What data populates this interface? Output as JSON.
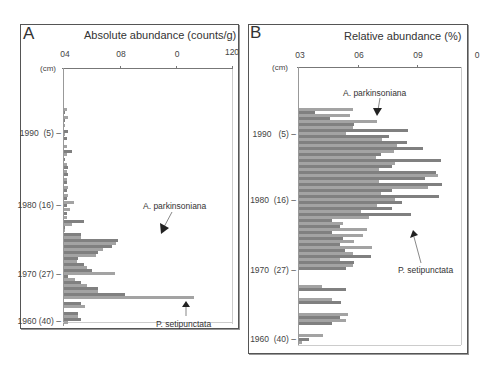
{
  "chart_data": [
    {
      "type": "bar",
      "orientation": "horizontal",
      "panel_letter": "A",
      "title": "Absolute abundance (counts/g)",
      "x_tick_labels": [
        "04",
        "08",
        "0",
        "120"
      ],
      "xlim": [
        0,
        120
      ],
      "ylabel": "(cm)",
      "y_tick_labels": [
        "1990 (5)",
        "1980 (16)",
        "1970 (27)",
        "1960 (40)"
      ],
      "annotations": [
        "A. parkinsoniana",
        "P. setipunctata"
      ],
      "series_colors": {
        "A. parkinsoniana": "#9a9a9a",
        "P. setipunctata": "#7d7d7d"
      },
      "bars": [
        {
          "y": 108,
          "v": 2,
          "s": 0
        },
        {
          "y": 111,
          "v": 1,
          "s": 1
        },
        {
          "y": 116,
          "v": 3,
          "s": 0
        },
        {
          "y": 119,
          "v": 1,
          "s": 1
        },
        {
          "y": 124,
          "v": 1,
          "s": 0
        },
        {
          "y": 130,
          "v": 3,
          "s": 1
        },
        {
          "y": 133,
          "v": 1,
          "s": 0
        },
        {
          "y": 137,
          "v": 2,
          "s": 1
        },
        {
          "y": 145,
          "v": 2,
          "s": 0
        },
        {
          "y": 150,
          "v": 6,
          "s": 1
        },
        {
          "y": 153,
          "v": 2,
          "s": 0
        },
        {
          "y": 158,
          "v": 1,
          "s": 1
        },
        {
          "y": 163,
          "v": 2,
          "s": 0
        },
        {
          "y": 166,
          "v": 3,
          "s": 1
        },
        {
          "y": 170,
          "v": 2,
          "s": 0
        },
        {
          "y": 173,
          "v": 3,
          "s": 1
        },
        {
          "y": 178,
          "v": 2,
          "s": 0
        },
        {
          "y": 181,
          "v": 2,
          "s": 1
        },
        {
          "y": 186,
          "v": 3,
          "s": 0
        },
        {
          "y": 189,
          "v": 2,
          "s": 1
        },
        {
          "y": 194,
          "v": 3,
          "s": 0
        },
        {
          "y": 197,
          "v": 2,
          "s": 1
        },
        {
          "y": 201,
          "v": 7,
          "s": 0
        },
        {
          "y": 204,
          "v": 2,
          "s": 1
        },
        {
          "y": 208,
          "v": 4,
          "s": 0
        },
        {
          "y": 212,
          "v": 2,
          "s": 1
        },
        {
          "y": 216,
          "v": 2,
          "s": 0
        },
        {
          "y": 220,
          "v": 14,
          "s": 1
        },
        {
          "y": 223,
          "v": 6,
          "s": 0
        },
        {
          "y": 226,
          "v": 1,
          "s": 1
        },
        {
          "y": 229,
          "v": 1,
          "s": 0
        },
        {
          "y": 233,
          "v": 12,
          "s": 1
        },
        {
          "y": 236,
          "v": 12,
          "s": 0
        },
        {
          "y": 239,
          "v": 38,
          "s": 1
        },
        {
          "y": 242,
          "v": 37,
          "s": 0
        },
        {
          "y": 245,
          "v": 34,
          "s": 1
        },
        {
          "y": 248,
          "v": 28,
          "s": 0
        },
        {
          "y": 251,
          "v": 24,
          "s": 1
        },
        {
          "y": 254,
          "v": 23,
          "s": 0
        },
        {
          "y": 257,
          "v": 10,
          "s": 1
        },
        {
          "y": 260,
          "v": 9,
          "s": 0
        },
        {
          "y": 263,
          "v": 14,
          "s": 1
        },
        {
          "y": 266,
          "v": 16,
          "s": 0
        },
        {
          "y": 269,
          "v": 20,
          "s": 1
        },
        {
          "y": 272,
          "v": 36,
          "s": 0
        },
        {
          "y": 275,
          "v": 3,
          "s": 1
        },
        {
          "y": 278,
          "v": 8,
          "s": 0
        },
        {
          "y": 281,
          "v": 12,
          "s": 1
        },
        {
          "y": 284,
          "v": 16,
          "s": 0
        },
        {
          "y": 287,
          "v": 24,
          "s": 1
        },
        {
          "y": 290,
          "v": 24,
          "s": 0
        },
        {
          "y": 293,
          "v": 43,
          "s": 1
        },
        {
          "y": 296,
          "v": 92,
          "s": 0
        },
        {
          "y": 302,
          "v": 12,
          "s": 1
        },
        {
          "y": 305,
          "v": 15,
          "s": 0
        },
        {
          "y": 312,
          "v": 10,
          "s": 1
        },
        {
          "y": 315,
          "v": 10,
          "s": 0
        },
        {
          "y": 318,
          "v": 12,
          "s": 1
        },
        {
          "y": 321,
          "v": 3,
          "s": 0
        }
      ]
    },
    {
      "type": "bar",
      "orientation": "horizontal",
      "panel_letter": "B",
      "title": "Relative abundance (%)",
      "x_tick_labels": [
        "03",
        "06",
        "09",
        "0"
      ],
      "xlim": [
        0,
        100
      ],
      "ylabel": "(cm)",
      "y_tick_labels": [
        "1990 (5)",
        "1980 (16)",
        "1970 (27)",
        "1960 (40)"
      ],
      "annotations": [
        "A. parkinsoniana",
        "P. setipunctata"
      ],
      "series_colors": {
        "A. parkinsoniana": "#9a9a9a",
        "P. setipunctata": "#7d7d7d"
      },
      "bars": [
        {
          "y": 108,
          "v": 33,
          "s": 0
        },
        {
          "y": 111,
          "v": 10,
          "s": 1
        },
        {
          "y": 114,
          "v": 31,
          "s": 0
        },
        {
          "y": 117,
          "v": 19,
          "s": 1
        },
        {
          "y": 120,
          "v": 48,
          "s": 0
        },
        {
          "y": 123,
          "v": 34,
          "s": 1
        },
        {
          "y": 126,
          "v": 33,
          "s": 0
        },
        {
          "y": 129,
          "v": 67,
          "s": 1
        },
        {
          "y": 132,
          "v": 29,
          "s": 0
        },
        {
          "y": 135,
          "v": 55,
          "s": 1
        },
        {
          "y": 138,
          "v": 51,
          "s": 0
        },
        {
          "y": 141,
          "v": 66,
          "s": 1
        },
        {
          "y": 144,
          "v": 60,
          "s": 0
        },
        {
          "y": 147,
          "v": 76,
          "s": 1
        },
        {
          "y": 150,
          "v": 58,
          "s": 0
        },
        {
          "y": 153,
          "v": 50,
          "s": 1
        },
        {
          "y": 156,
          "v": 47,
          "s": 0
        },
        {
          "y": 159,
          "v": 87,
          "s": 1
        },
        {
          "y": 162,
          "v": 59,
          "s": 0
        },
        {
          "y": 165,
          "v": 57,
          "s": 1
        },
        {
          "y": 168,
          "v": 49,
          "s": 0
        },
        {
          "y": 171,
          "v": 84,
          "s": 1
        },
        {
          "y": 174,
          "v": 85,
          "s": 0
        },
        {
          "y": 177,
          "v": 77,
          "s": 1
        },
        {
          "y": 180,
          "v": 49,
          "s": 0
        },
        {
          "y": 183,
          "v": 88,
          "s": 1
        },
        {
          "y": 186,
          "v": 79,
          "s": 0
        },
        {
          "y": 189,
          "v": 57,
          "s": 1
        },
        {
          "y": 192,
          "v": 50,
          "s": 0
        },
        {
          "y": 195,
          "v": 86,
          "s": 1
        },
        {
          "y": 198,
          "v": 59,
          "s": 0
        },
        {
          "y": 201,
          "v": 63,
          "s": 1
        },
        {
          "y": 204,
          "v": 48,
          "s": 0
        },
        {
          "y": 207,
          "v": 57,
          "s": 1
        },
        {
          "y": 210,
          "v": 38,
          "s": 0
        },
        {
          "y": 213,
          "v": 69,
          "s": 1
        },
        {
          "y": 216,
          "v": 43,
          "s": 0
        },
        {
          "y": 219,
          "v": 20,
          "s": 1
        },
        {
          "y": 222,
          "v": 27,
          "s": 0
        },
        {
          "y": 225,
          "v": 25,
          "s": 1
        },
        {
          "y": 228,
          "v": 42,
          "s": 0
        },
        {
          "y": 231,
          "v": 20,
          "s": 1
        },
        {
          "y": 234,
          "v": 39,
          "s": 0
        },
        {
          "y": 237,
          "v": 27,
          "s": 1
        },
        {
          "y": 240,
          "v": 34,
          "s": 0
        },
        {
          "y": 243,
          "v": 25,
          "s": 1
        },
        {
          "y": 246,
          "v": 45,
          "s": 0
        },
        {
          "y": 249,
          "v": 28,
          "s": 1
        },
        {
          "y": 252,
          "v": 33,
          "s": 0
        },
        {
          "y": 255,
          "v": 44,
          "s": 1
        },
        {
          "y": 258,
          "v": 25,
          "s": 0
        },
        {
          "y": 261,
          "v": 34,
          "s": 1
        },
        {
          "y": 264,
          "v": 33,
          "s": 0
        },
        {
          "y": 267,
          "v": 29,
          "s": 1
        },
        {
          "y": 285,
          "v": 14,
          "s": 0
        },
        {
          "y": 288,
          "v": 29,
          "s": 1
        },
        {
          "y": 298,
          "v": 20,
          "s": 0
        },
        {
          "y": 301,
          "v": 26,
          "s": 1
        },
        {
          "y": 313,
          "v": 30,
          "s": 0
        },
        {
          "y": 316,
          "v": 25,
          "s": 1
        },
        {
          "y": 319,
          "v": 29,
          "s": 0
        },
        {
          "y": 322,
          "v": 20,
          "s": 1
        },
        {
          "y": 334,
          "v": 15,
          "s": 0
        },
        {
          "y": 338,
          "v": 6,
          "s": 1
        },
        {
          "y": 341,
          "v": 2,
          "s": 0
        }
      ]
    }
  ],
  "panels": {
    "a": {
      "letter": "A",
      "title": "Absolute abundance (counts/g)",
      "cm": "(cm)",
      "ticks": [
        "04",
        "08",
        "0",
        "120"
      ],
      "years": [
        "1990",
        "1980",
        "1970",
        "1960"
      ],
      "depths": [
        "(5)",
        "(16)",
        "(27)",
        "(40)"
      ],
      "label_a": "A. parkinsoniana",
      "label_p": "P. setipunctata"
    },
    "b": {
      "letter": "B",
      "title": "Relative abundance (%)",
      "cm": "(cm)",
      "ticks": [
        "03",
        "06",
        "09",
        "0"
      ],
      "years": [
        "1990",
        "1980",
        "1970",
        "1960"
      ],
      "depths": [
        "(5)",
        "(16)",
        "(27)",
        "(40)"
      ],
      "label_a": "A. parkinsoniana",
      "label_p": "P. setipunctata"
    }
  },
  "colors": {
    "bar_light": "#a3a3a3",
    "bar_dark": "#808080",
    "frame": "#555555"
  }
}
